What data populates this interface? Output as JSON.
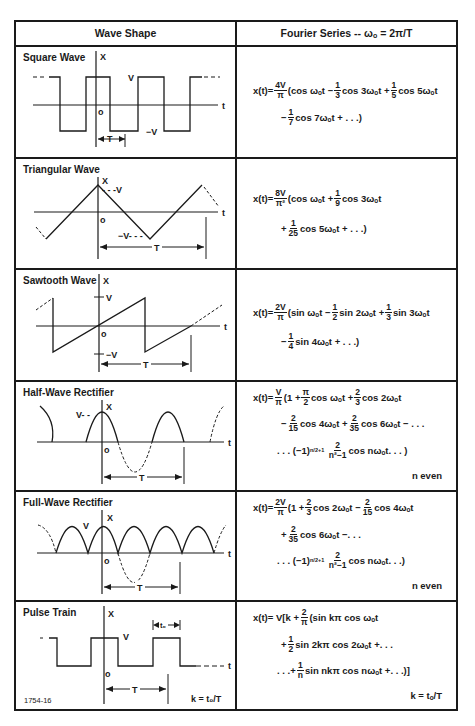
{
  "header": {
    "col1": "Wave Shape",
    "col2": "Fourier Series -- ωₒ = 2π/T"
  },
  "rows": [
    {
      "name": "Square Wave",
      "labels": {
        "x": "X",
        "v": "V",
        "neg_v": "−V",
        "o": "o",
        "t": "t",
        "period": "T"
      },
      "formula": {
        "prefix": "x(t)=",
        "coef_num": "4V",
        "coef_den": "π",
        "line1": [
          "(cos ωₒt −",
          "1",
          "3",
          "cos 3ωₒt +",
          "1",
          "5",
          "cos 5ωₒt"
        ],
        "line2": [
          "−",
          "1",
          "7",
          "cos 7ωₒt + . . .)"
        ]
      }
    },
    {
      "name": "Triangular Wave",
      "labels": {
        "x": "X",
        "v": "- - -V",
        "neg_v": "−V- - -",
        "o": "o",
        "t": "t",
        "period": "T"
      },
      "formula": {
        "prefix": "x(t)=",
        "coef_num": "8V",
        "coef_den": "π²",
        "line1": [
          "(cos ωₒt +",
          "1",
          "9",
          "cos 3ωₒt"
        ],
        "line2": [
          "+",
          "1",
          "25",
          "cos 5ωₒt + . . .)"
        ]
      }
    },
    {
      "name": "Sawtooth Wave",
      "labels": {
        "x": "X",
        "v": "V",
        "neg_v": "−V",
        "o": "o",
        "t": "t",
        "period": "T"
      },
      "formula": {
        "prefix": "x(t)=",
        "coef_num": "2V",
        "coef_den": "π",
        "line1": [
          "(sin ωₒt −",
          "1",
          "2",
          "sin 2ωₒt +",
          "1",
          "3",
          "sin 3ωₒt"
        ],
        "line2": [
          "−",
          "1",
          "4",
          "sin 4ωₒt + . . .)"
        ]
      }
    },
    {
      "name": "Half-Wave Rectifier",
      "labels": {
        "x": "X",
        "v": "V- -",
        "o": "o",
        "t": "t",
        "period": "T"
      },
      "formula": {
        "prefix": "x(t)=",
        "coef_num": "V",
        "coef_den": "π",
        "line1": [
          "(1 +",
          "π",
          "2",
          "cos ωₒt +",
          "2",
          "3",
          "cos 2ωₒt"
        ],
        "line2": [
          "−",
          "2",
          "15",
          "cos 4ωₒt +",
          "2",
          "35",
          "cos 6ωₒt − . . ."
        ],
        "line3": [
          ". . . (−1)",
          "n/2+1",
          "2",
          "n²−1",
          "cos nωₒt. . . )"
        ],
        "note": "n even"
      }
    },
    {
      "name": "Full-Wave Rectifier",
      "labels": {
        "x": "X",
        "v": "V",
        "o": "o",
        "t": "t",
        "period": "T"
      },
      "formula": {
        "prefix": "x(t)=",
        "coef_num": "2V",
        "coef_den": "π",
        "line1": [
          "(1 +",
          "2",
          "3",
          "cos 2ωₒt −",
          "2",
          "15",
          "cos 4ωₒt"
        ],
        "line2": [
          "+",
          "2",
          "35",
          "cos 6ωₒt −. . ."
        ],
        "line3": [
          ". . . (−1)",
          "n/2+1",
          "2",
          "n²−1",
          "cos nωₒt. . .)"
        ],
        "note": "n even"
      }
    },
    {
      "name": "Pulse Train",
      "labels": {
        "x": "X",
        "v": "V",
        "o": "o",
        "t": "t",
        "period": "T",
        "t0": "tₒ"
      },
      "k_note": "k = tₒ/T",
      "figure_id": "1754-16",
      "formula": {
        "prefix": "x(t)= V[k +",
        "coef_num": "2",
        "coef_den": "π",
        "line1": [
          "(sin kπ cos ωₒt"
        ],
        "line2": [
          "+",
          "1",
          "2",
          "sin 2kπ cos 2ωₒt +. . ."
        ],
        "line3": [
          ". . .+",
          "1",
          "n",
          "sin nkπ cos nωₒt +. . .)]"
        ],
        "note": "k = tₒ/T"
      }
    }
  ]
}
